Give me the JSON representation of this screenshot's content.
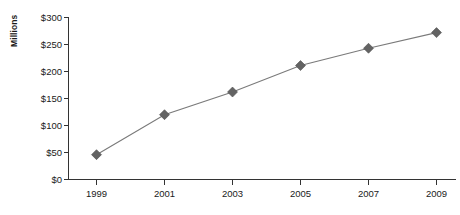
{
  "chart_data": {
    "type": "line",
    "title": "",
    "subtitle": "",
    "xlabel": "",
    "ylabel": "Millions",
    "categories": [
      "1999",
      "2001",
      "2003",
      "2005",
      "2007",
      "2009"
    ],
    "x": [
      1999,
      2001,
      2003,
      2005,
      2007,
      2009
    ],
    "values": [
      46,
      120,
      162,
      211,
      243,
      272
    ],
    "series": [
      {
        "name": "",
        "values": [
          46,
          120,
          162,
          211,
          243,
          272
        ]
      }
    ],
    "ylim": [
      0,
      300
    ],
    "yticks": [
      0,
      50,
      100,
      150,
      200,
      250,
      300
    ],
    "ytick_labels": [
      "$0",
      "$50",
      "$100",
      "$150",
      "$200",
      "$250",
      "$300"
    ],
    "xtick_labels": [
      "1999",
      "2001",
      "2003",
      "2005",
      "2007",
      "2009"
    ],
    "grid": false,
    "legend": false,
    "legend_position": "none",
    "marker": "diamond",
    "colors": {
      "line": "#7a7a7a",
      "marker": "#636363",
      "axis": "#333333",
      "text": "#1a1a1a",
      "background": "#ffffff"
    }
  },
  "axis": {
    "y_title": "Millions",
    "y_labels": {
      "t300": "$300",
      "t250": "$250",
      "t200": "$200",
      "t150": "$150",
      "t100": "$100",
      "t50": "$50",
      "t0": "$0"
    },
    "x_labels": {
      "p1": "1999",
      "p2": "2001",
      "p3": "2003",
      "p4": "2005",
      "p5": "2007",
      "p6": "2009"
    }
  }
}
